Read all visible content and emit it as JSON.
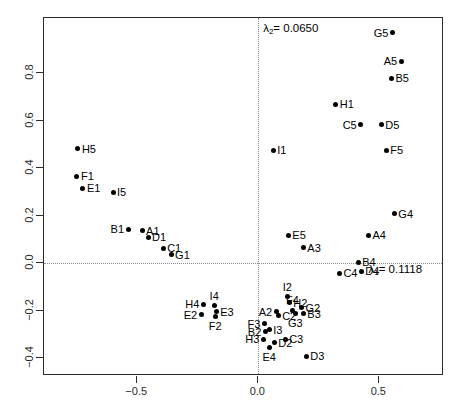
{
  "chart_data": {
    "type": "scatter",
    "title": "",
    "xlabel": "",
    "ylabel": "",
    "xlim": [
      -0.885,
      0.767
    ],
    "ylim": [
      -0.475,
      1.033
    ],
    "xticks": [
      -0.5,
      0.0,
      0.5
    ],
    "xticklabels": [
      "-0.5",
      "0.0",
      "0.5"
    ],
    "yticks": [
      -0.4,
      -0.2,
      0.0,
      0.2,
      0.4,
      0.6,
      0.8
    ],
    "yticklabels": [
      "-0.4",
      "-0.2",
      "0.0",
      "0.2",
      "0.4",
      "0.6",
      "0.8"
    ],
    "grid": false,
    "reference_lines": {
      "horizontal": 0.0,
      "vertical": 0.0,
      "style": "dotted"
    },
    "annotations": [
      {
        "id": "lambda2",
        "text_prefix": "λ",
        "subscript": "2",
        "text_suffix": "= 0.0650",
        "x": 0.02,
        "y": 0.985
      },
      {
        "id": "lambda1",
        "text_prefix": "λ",
        "subscript": "1",
        "text_suffix": "= 0.1118",
        "x": 0.455,
        "y": -0.028
      }
    ],
    "points": [
      {
        "label": "H5",
        "x": -0.745,
        "y": 0.483,
        "lpos": "right"
      },
      {
        "label": "F1",
        "x": -0.749,
        "y": 0.367,
        "lpos": "right"
      },
      {
        "label": "E1",
        "x": -0.724,
        "y": 0.316,
        "lpos": "right"
      },
      {
        "label": "I5",
        "x": -0.6,
        "y": 0.299,
        "lpos": "right"
      },
      {
        "label": "B1",
        "x": -0.538,
        "y": 0.143,
        "lpos": "left"
      },
      {
        "label": "A1",
        "x": -0.48,
        "y": 0.137,
        "lpos": "right"
      },
      {
        "label": "D1",
        "x": -0.455,
        "y": 0.11,
        "lpos": "right"
      },
      {
        "label": "C1",
        "x": -0.393,
        "y": 0.064,
        "lpos": "right"
      },
      {
        "label": "G1",
        "x": -0.36,
        "y": 0.035,
        "lpos": "right"
      },
      {
        "label": "G5",
        "x": 0.554,
        "y": 0.97,
        "lpos": "left"
      },
      {
        "label": "A5",
        "x": 0.59,
        "y": 0.85,
        "lpos": "left"
      },
      {
        "label": "B5",
        "x": 0.55,
        "y": 0.78,
        "lpos": "right"
      },
      {
        "label": "H1",
        "x": 0.32,
        "y": 0.669,
        "lpos": "right"
      },
      {
        "label": "C5",
        "x": 0.423,
        "y": 0.584,
        "lpos": "left"
      },
      {
        "label": "D5",
        "x": 0.508,
        "y": 0.584,
        "lpos": "right"
      },
      {
        "label": "F5",
        "x": 0.529,
        "y": 0.476,
        "lpos": "right"
      },
      {
        "label": "I1",
        "x": 0.062,
        "y": 0.476,
        "lpos": "right"
      },
      {
        "label": "E5",
        "x": 0.124,
        "y": 0.117,
        "lpos": "right"
      },
      {
        "label": "A3",
        "x": 0.186,
        "y": 0.066,
        "lpos": "right"
      },
      {
        "label": "A4",
        "x": 0.455,
        "y": 0.117,
        "lpos": "right"
      },
      {
        "label": "G4",
        "x": 0.562,
        "y": 0.209,
        "lpos": "right"
      },
      {
        "label": "B4",
        "x": 0.413,
        "y": 0.005,
        "lpos": "right"
      },
      {
        "label": "D4",
        "x": 0.425,
        "y": -0.033,
        "lpos": "right"
      },
      {
        "label": "C4",
        "x": 0.335,
        "y": -0.042,
        "lpos": "right"
      },
      {
        "label": "H4",
        "x": -0.227,
        "y": -0.172,
        "lpos": "left"
      },
      {
        "label": "I4",
        "x": -0.182,
        "y": -0.18,
        "lpos": "top"
      },
      {
        "label": "E3",
        "x": -0.174,
        "y": -0.205,
        "lpos": "right"
      },
      {
        "label": "F2",
        "x": -0.178,
        "y": -0.225,
        "lpos": "bottom"
      },
      {
        "label": "E2",
        "x": -0.236,
        "y": -0.218,
        "lpos": "left"
      },
      {
        "label": "I2",
        "x": 0.12,
        "y": -0.142,
        "lpos": "top"
      },
      {
        "label": "H2",
        "x": 0.128,
        "y": -0.167,
        "lpos": "right"
      },
      {
        "label": "F4",
        "x": 0.141,
        "y": -0.197,
        "lpos": "top"
      },
      {
        "label": "G2",
        "x": 0.178,
        "y": -0.188,
        "lpos": "right"
      },
      {
        "label": "A2",
        "x": 0.074,
        "y": -0.205,
        "lpos": "left"
      },
      {
        "label": "C2",
        "x": 0.082,
        "y": -0.222,
        "lpos": "right"
      },
      {
        "label": "G3",
        "x": 0.153,
        "y": -0.213,
        "lpos": "bottom"
      },
      {
        "label": "B3",
        "x": 0.186,
        "y": -0.213,
        "lpos": "right"
      },
      {
        "label": "F3",
        "x": 0.025,
        "y": -0.255,
        "lpos": "left"
      },
      {
        "label": "I3",
        "x": 0.045,
        "y": -0.28,
        "lpos": "right"
      },
      {
        "label": "B2",
        "x": 0.029,
        "y": -0.288,
        "lpos": "left"
      },
      {
        "label": "H3",
        "x": 0.021,
        "y": -0.321,
        "lpos": "left"
      },
      {
        "label": "D2",
        "x": 0.066,
        "y": -0.334,
        "lpos": "right"
      },
      {
        "label": "C3",
        "x": 0.111,
        "y": -0.321,
        "lpos": "right"
      },
      {
        "label": "E4",
        "x": 0.045,
        "y": -0.355,
        "lpos": "bottom"
      },
      {
        "label": "D3",
        "x": 0.198,
        "y": -0.392,
        "lpos": "right"
      }
    ]
  }
}
